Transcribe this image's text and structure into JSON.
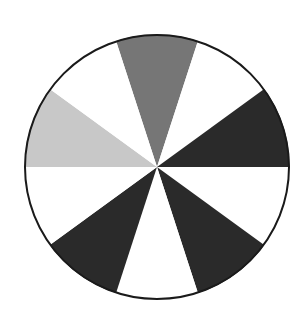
{
  "figure": {
    "name": "sector-wheel",
    "kind": "pie",
    "background_color": "#ffffff",
    "canvas": {
      "width": 307,
      "height": 330
    }
  },
  "chart_data": {
    "type": "pie",
    "title": "",
    "subtitle": "",
    "xlabel": "",
    "ylabel": "",
    "grid": false,
    "legend": "none",
    "annotations": [],
    "tick_labels": [],
    "geometry": {
      "center_x": 157,
      "center_y": 167,
      "radius": 132,
      "outline_color": "#1a1a1a",
      "outline_width": 2,
      "sector_count": 10,
      "sector_angle_deg": 36,
      "start_angle_deg": -18
    },
    "categories": [
      "sector-1",
      "sector-2",
      "sector-3",
      "sector-4",
      "sector-5",
      "sector-6",
      "sector-7",
      "sector-8",
      "sector-9",
      "sector-10"
    ],
    "values": [
      36,
      36,
      36,
      36,
      36,
      36,
      36,
      36,
      36,
      36
    ],
    "colors": [
      "#767676",
      "#ffffff",
      "#2a2a2a",
      "#ffffff",
      "#2a2a2a",
      "#ffffff",
      "#2a2a2a",
      "#ffffff",
      "#c8c8c8",
      "#ffffff"
    ],
    "sectors": [
      {
        "name": "sector-top-gray",
        "index": 0,
        "start_deg": -18,
        "end_deg": 18,
        "color": "#767676",
        "fill_label": "medium-gray"
      },
      {
        "name": "sector-upper-right-white",
        "index": 1,
        "start_deg": 18,
        "end_deg": 54,
        "color": "#ffffff",
        "fill_label": "white"
      },
      {
        "name": "sector-right-dark",
        "index": 2,
        "start_deg": 54,
        "end_deg": 90,
        "color": "#2a2a2a",
        "fill_label": "dark"
      },
      {
        "name": "sector-lower-right-white",
        "index": 3,
        "start_deg": 90,
        "end_deg": 126,
        "color": "#ffffff",
        "fill_label": "white"
      },
      {
        "name": "sector-bottom-right-dark",
        "index": 4,
        "start_deg": 126,
        "end_deg": 162,
        "color": "#2a2a2a",
        "fill_label": "dark"
      },
      {
        "name": "sector-bottom-white",
        "index": 5,
        "start_deg": 162,
        "end_deg": 198,
        "color": "#ffffff",
        "fill_label": "white"
      },
      {
        "name": "sector-bottom-left-dark",
        "index": 6,
        "start_deg": 198,
        "end_deg": 234,
        "color": "#2a2a2a",
        "fill_label": "dark"
      },
      {
        "name": "sector-left-white",
        "index": 7,
        "start_deg": 234,
        "end_deg": 270,
        "color": "#ffffff",
        "fill_label": "white"
      },
      {
        "name": "sector-upper-left-light",
        "index": 8,
        "start_deg": 270,
        "end_deg": 306,
        "color": "#c8c8c8",
        "fill_label": "light-gray"
      },
      {
        "name": "sector-top-left-white",
        "index": 9,
        "start_deg": 306,
        "end_deg": 342,
        "color": "#ffffff",
        "fill_label": "white"
      }
    ]
  }
}
